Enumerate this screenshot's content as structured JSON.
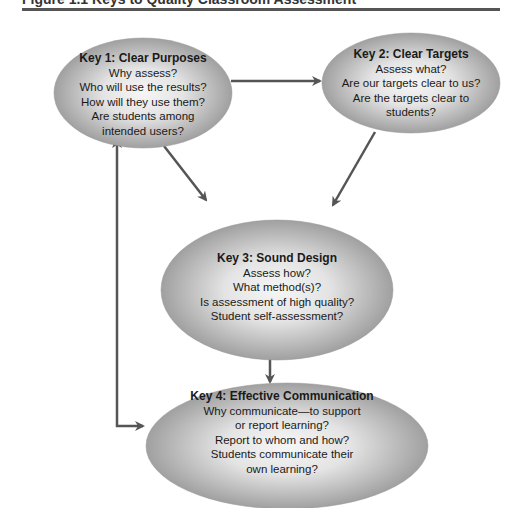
{
  "figure": {
    "caption_partial": "Figure 1.1 Keys to Quality Classroom Assessment"
  },
  "colors": {
    "ellipse_fill_center": "#f4f4f4",
    "ellipse_fill_edge": "#9d9d9d",
    "arrow": "#555555",
    "rule": "#555555",
    "text": "#1a1a1a"
  },
  "nodes": [
    {
      "id": "key1",
      "title": "Key 1: Clear Purposes",
      "lines": [
        "Why assess?",
        "Who will use the results?",
        "How will they use them?",
        "Are students among",
        "intended users?"
      ]
    },
    {
      "id": "key2",
      "title": "Key 2: Clear Targets",
      "lines": [
        "Assess what?",
        "Are our targets clear to us?",
        "Are the targets clear to",
        "students?"
      ]
    },
    {
      "id": "key3",
      "title": "Key 3: Sound Design",
      "lines": [
        "Assess how?",
        "What method(s)?",
        "Is assessment of high quality?",
        "Student self-assessment?"
      ]
    },
    {
      "id": "key4",
      "title": "Key 4: Effective Communication",
      "lines": [
        "Why communicate—to support",
        "or report learning?",
        "Report to whom and how?",
        "Students communicate their",
        "own learning?"
      ]
    }
  ],
  "edges": [
    {
      "from": "key1",
      "to": "key2",
      "direction": "forward"
    },
    {
      "from": "key1",
      "to": "key3",
      "direction": "forward"
    },
    {
      "from": "key2",
      "to": "key3",
      "direction": "forward"
    },
    {
      "from": "key3",
      "to": "key4",
      "direction": "forward"
    },
    {
      "from": "key1",
      "to": "key4",
      "direction": "bidirectional"
    }
  ]
}
